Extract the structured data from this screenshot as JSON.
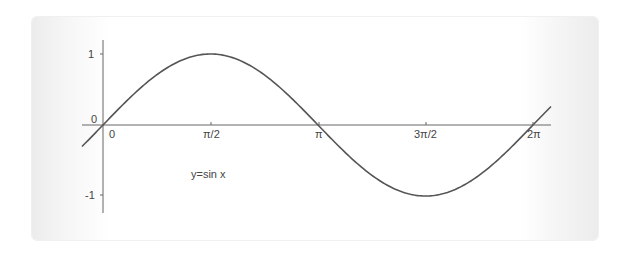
{
  "chart_data": {
    "type": "line",
    "title": "y=sin x",
    "xlabel": "",
    "ylabel": "",
    "x_ticks": [
      "0",
      "π/2",
      "π",
      "3π/2",
      "2π"
    ],
    "y_ticks": [
      "1",
      "0",
      "-1"
    ],
    "xlim": [
      -0.35,
      6.65
    ],
    "ylim": [
      -1.2,
      1.2
    ],
    "grid": false,
    "legend": null,
    "series": [
      {
        "name": "y=sin x",
        "x": [
          0,
          0.785,
          1.571,
          2.356,
          3.142,
          3.927,
          4.712,
          5.498,
          6.283
        ],
        "values": [
          0,
          0.707,
          1,
          0.707,
          0,
          -0.707,
          -1,
          -0.707,
          0
        ]
      }
    ],
    "annotations": [
      {
        "text": "y=sin x",
        "x": 2.6,
        "y": -0.62
      }
    ],
    "colors": {
      "curve": "#555555",
      "axis": "#666666",
      "text": "#444444"
    }
  },
  "labels": {
    "origin": "0",
    "x0": "0",
    "x1": "π/2",
    "x2": "π",
    "x3": "3π/2",
    "x4": "2π",
    "y_pos": "1",
    "y_neg": "-1",
    "func": "y=sin x"
  }
}
